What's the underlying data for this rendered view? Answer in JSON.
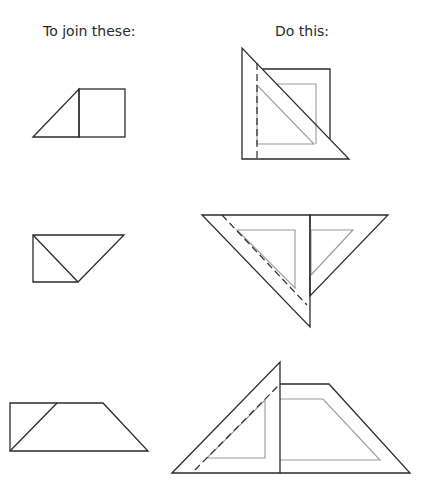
{
  "headers": {
    "left": "To join these:",
    "right": "Do this:"
  },
  "rows": [
    {
      "name": "right-triangle-and-square",
      "pieces": "45-degree triangle + square",
      "method": "Align set-square edge along the shared vertical edge (dashed guide)"
    },
    {
      "name": "two-triangles",
      "pieces": "right triangle + right triangle forming inverted trapezoid",
      "method": "Align set-square along diagonal join (dashed guide)"
    },
    {
      "name": "triangle-and-trapezoid",
      "pieces": "right triangle + trapezoid",
      "method": "Align set-square along diagonal join (dashed guide)"
    }
  ],
  "colors": {
    "outline": "#2b2b2b",
    "inner_outline": "#9a9a9a",
    "background": "#ffffff"
  }
}
